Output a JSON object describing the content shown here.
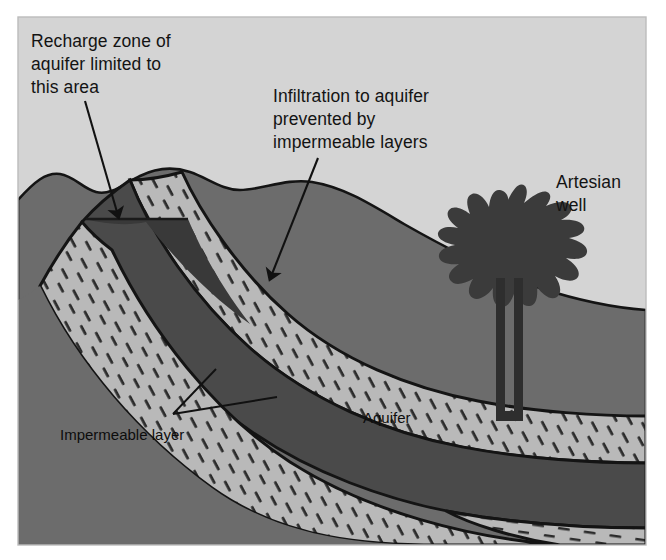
{
  "figure": {
    "background_color": "#ffffff",
    "sky_color": "#d4d4d4",
    "canvas": {
      "width": 666,
      "height": 560
    }
  },
  "labels": {
    "recharge": {
      "lines": [
        "Recharge zone of",
        "aquifer limited to",
        "this area"
      ],
      "line1": "Recharge zone of",
      "line2": "aquifer limited to",
      "line3": "this area"
    },
    "infiltration": {
      "lines": [
        "Infiltration to aquifer",
        "prevented by",
        "impermeable layers"
      ],
      "line1": "Infiltration to aquifer",
      "line2": "prevented by",
      "line3": "impermeable layers"
    },
    "artesian_well": {
      "lines": [
        "Artesian",
        "well"
      ],
      "line1": "Artesian",
      "line2": "well"
    },
    "aquifer": "Aquifer",
    "impermeable_layer": "Impermeable layer"
  },
  "geology": {
    "layers": [
      {
        "name": "sky",
        "label": "Sky / air",
        "color": "#d4d4d4"
      },
      {
        "name": "surface-rock",
        "label": "Surface bedrock",
        "color": "#6c6c6c"
      },
      {
        "name": "impermeable-upper",
        "label": "Impermeable layer (upper)",
        "color": "#b9b9b9"
      },
      {
        "name": "aquifer",
        "label": "Aquifer",
        "color": "#4a4a4a"
      },
      {
        "name": "impermeable-lower",
        "label": "Impermeable layer (lower)",
        "color": "#b9b9b9"
      },
      {
        "name": "basement-rock",
        "label": "Basement rock",
        "color": "#6c6c6c"
      }
    ],
    "recharge_zone": {
      "label": "Recharge zone",
      "color": "#393939"
    },
    "water_table_line_color": "#1a1a1a",
    "outline_color": "#141414",
    "dash_mark_color": "#2b2b2b"
  },
  "well": {
    "casing_color": "#2e2e2e",
    "spray_color": "#3b3b3b",
    "casing_left_x": 496,
    "casing_right_x": 520,
    "casing_top_y": 278,
    "casing_bottom_y": 420
  },
  "annotations": {
    "recharge_arrow": {
      "from": [
        85,
        101
      ],
      "to": [
        119,
        222
      ]
    },
    "infiltration_arrow": {
      "from": [
        315,
        150
      ],
      "to": [
        270,
        283
      ]
    },
    "impermeable_leader_a": {
      "from": [
        173,
        415
      ],
      "to": [
        216,
        372
      ]
    },
    "impermeable_leader_b": {
      "from": [
        173,
        415
      ],
      "to": [
        274,
        398
      ]
    }
  }
}
